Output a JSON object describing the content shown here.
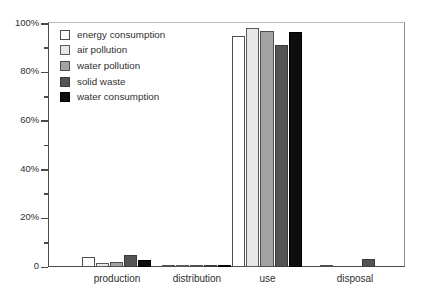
{
  "chart_data": {
    "type": "bar",
    "title": "",
    "subtitle": "",
    "xlabel": "",
    "ylabel": "",
    "categories": [
      "production",
      "distribution",
      "use",
      "disposal"
    ],
    "ylim": [
      0,
      100
    ],
    "y_unit": "%",
    "y_ticks_major": [
      "0",
      "20%",
      "40%",
      "60%",
      "80%",
      "100%"
    ],
    "y_tick_values_major": [
      0,
      20,
      40,
      60,
      80,
      100
    ],
    "y_tick_values_minor": [
      10,
      30,
      50,
      70,
      90
    ],
    "grid": false,
    "legend_position": "upper-left-inside",
    "series": [
      {
        "name": "energy consumption",
        "color": "#ffffff",
        "values": [
          4.0,
          0.6,
          95.0,
          0.4
        ]
      },
      {
        "name": "air pollution",
        "color": "#e7e7e7",
        "values": [
          1.6,
          0.5,
          98.0,
          0.0
        ]
      },
      {
        "name": "water pollution",
        "color": "#a3a3a3",
        "values": [
          2.2,
          0.6,
          97.0,
          0.0
        ]
      },
      {
        "name": "solid waste",
        "color": "#545454",
        "values": [
          5.0,
          0.6,
          91.0,
          3.2
        ]
      },
      {
        "name": "water consumption",
        "color": "#0d0d0d",
        "values": [
          3.0,
          0.5,
          96.5,
          0.0
        ]
      }
    ]
  },
  "legend": {
    "items": [
      {
        "label": "energy consumption"
      },
      {
        "label": "air pollution"
      },
      {
        "label": "water pollution"
      },
      {
        "label": "solid waste"
      },
      {
        "label": "water consumption"
      }
    ]
  }
}
